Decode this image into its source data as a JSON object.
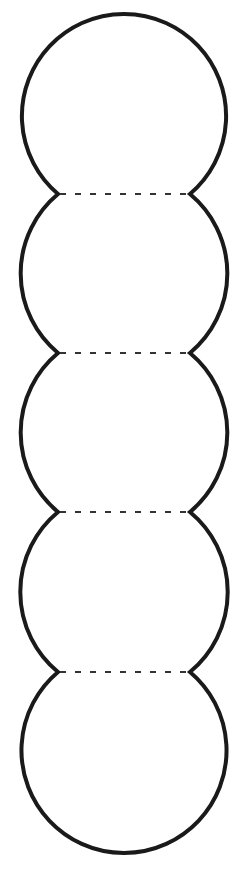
{
  "diagram": {
    "stroke_color": "#1a1a1a",
    "fold_line_color": "#333333",
    "circle_count": 5,
    "center_x": 124,
    "radius": 104,
    "joints_y": [
      194,
      353,
      512,
      672
    ],
    "joint_left_x": 58,
    "joint_right_x": 190,
    "top_y": 14,
    "bottom_y": 853
  }
}
